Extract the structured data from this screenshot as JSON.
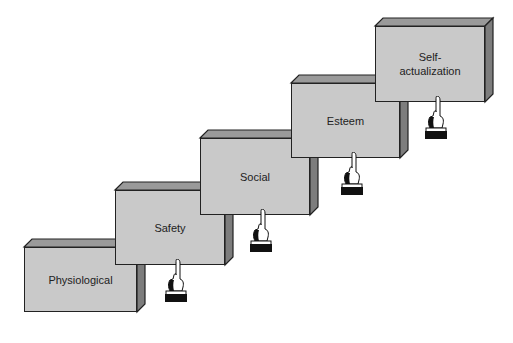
{
  "diagram": {
    "title": "",
    "steps": [
      {
        "label": "Physiological",
        "lines": [
          "Physiological"
        ],
        "x": 24,
        "y": 247,
        "w": 113,
        "h": 65
      },
      {
        "label": "Safety",
        "lines": [
          "Safety"
        ],
        "x": 115,
        "y": 190,
        "w": 110,
        "h": 75
      },
      {
        "label": "Social",
        "lines": [
          "Social"
        ],
        "x": 200,
        "y": 138,
        "w": 110,
        "h": 77
      },
      {
        "label": "Esteem",
        "lines": [
          "Esteem"
        ],
        "x": 291,
        "y": 83,
        "w": 109,
        "h": 75
      },
      {
        "label": "Self-actualization",
        "lines": [
          "Self-",
          "actualization"
        ],
        "x": 375,
        "y": 26,
        "w": 110,
        "h": 76
      }
    ],
    "depth": 8,
    "colors": {
      "front": "#c9c9c9",
      "top": "#9a9a9a",
      "side": "#7d7d7d",
      "outline": "#222222",
      "hand_cuff": "#111111"
    }
  }
}
